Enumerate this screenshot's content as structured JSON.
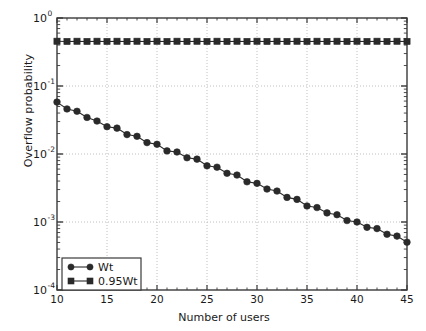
{
  "chart_data": {
    "type": "line",
    "title": "",
    "xlabel": "Number of users",
    "ylabel": "Overflow probability",
    "xlim": [
      10,
      45
    ],
    "ylim": [
      0.0001,
      1
    ],
    "yscale": "log",
    "xscale": "linear",
    "grid": true,
    "grid_style": "dotted",
    "legend_position": "lower left",
    "xticks": [
      10,
      15,
      20,
      25,
      30,
      35,
      40,
      45
    ],
    "xticklabels": [
      "10",
      "15",
      "20",
      "25",
      "30",
      "35",
      "40",
      "45"
    ],
    "yticks": [
      1,
      0.1,
      0.01,
      0.001,
      0.0001
    ],
    "yticklabels": [
      "10^0",
      "10^-1",
      "10^-2",
      "10^-3",
      "10^-4"
    ],
    "ytick_bases": [
      "10",
      "10",
      "10",
      "10",
      "10"
    ],
    "ytick_exponents": [
      "0",
      "-1",
      "-2",
      "-3",
      "-4"
    ],
    "x": [
      10,
      11,
      12,
      13,
      14,
      15,
      16,
      17,
      18,
      19,
      20,
      21,
      22,
      23,
      24,
      25,
      26,
      27,
      28,
      29,
      30,
      31,
      32,
      33,
      34,
      35,
      36,
      37,
      38,
      39,
      40,
      41,
      42,
      43,
      44,
      45
    ],
    "series": [
      {
        "name": "Wt",
        "marker": "circle",
        "color": "#2a2a2a",
        "values": [
          0.058,
          0.046,
          0.0425,
          0.0345,
          0.0305,
          0.0252,
          0.024,
          0.0193,
          0.0182,
          0.0147,
          0.0139,
          0.0111,
          0.0107,
          0.0088,
          0.0084,
          0.0067,
          0.0064,
          0.0052,
          0.0049,
          0.0039,
          0.0037,
          0.00305,
          0.00285,
          0.0023,
          0.00215,
          0.00172,
          0.00163,
          0.00136,
          0.00128,
          0.00105,
          0.001,
          0.000835,
          0.0008,
          0.00066,
          0.00062,
          0.000505
        ]
      },
      {
        "name": "0.95Wt",
        "marker": "square",
        "color": "#2a2a2a",
        "values": [
          0.455,
          0.452,
          0.455,
          0.452,
          0.455,
          0.452,
          0.455,
          0.452,
          0.455,
          0.452,
          0.455,
          0.452,
          0.455,
          0.452,
          0.455,
          0.452,
          0.455,
          0.452,
          0.455,
          0.452,
          0.455,
          0.452,
          0.455,
          0.452,
          0.455,
          0.452,
          0.455,
          0.452,
          0.455,
          0.452,
          0.455,
          0.452,
          0.455,
          0.452,
          0.455,
          0.452
        ]
      }
    ]
  },
  "legend": {
    "entries": [
      {
        "label": "Wt"
      },
      {
        "label": "0.95Wt"
      }
    ]
  },
  "axes": {
    "xlabel": "Number of users",
    "ylabel": "Overflow probability"
  }
}
